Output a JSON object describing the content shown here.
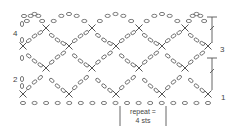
{
  "diagram": {
    "type": "crochet-chart",
    "stitch_color": "#6b6b6b",
    "row_labels": [
      {
        "text": "4",
        "side": "left"
      },
      {
        "text": "3",
        "side": "right"
      },
      {
        "text": "2",
        "side": "left"
      },
      {
        "text": "1",
        "side": "right"
      }
    ],
    "repeat_label": {
      "line1": "repeat =",
      "line2": "4 sts"
    },
    "symbols": {
      "chain": "oval",
      "single_crochet": "X"
    },
    "foundation_chain_count": 17,
    "repeats_shown": 4
  }
}
